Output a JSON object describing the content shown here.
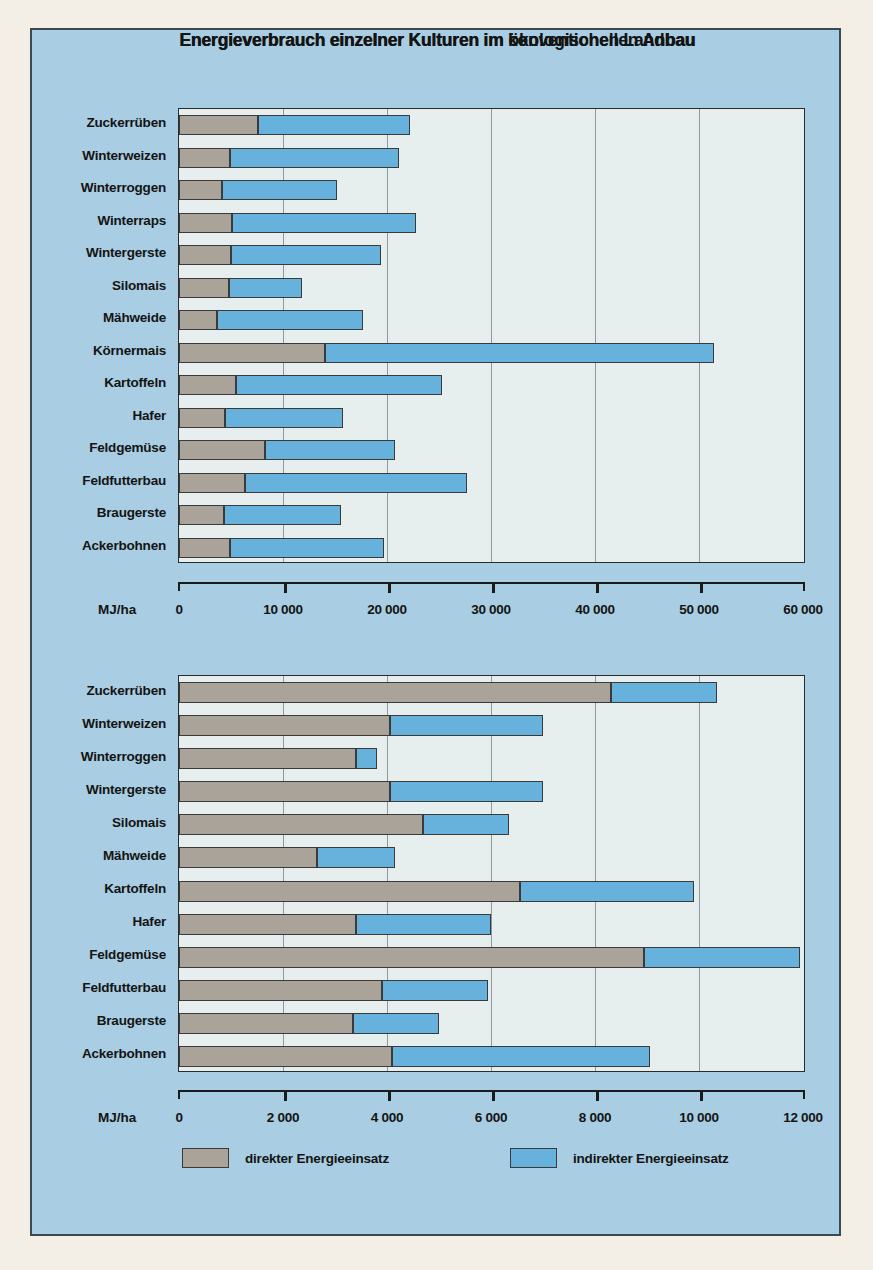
{
  "poster": {
    "background_color": "#a9cde2",
    "page_color": "#f3efe6",
    "border_color": "#3a4a52"
  },
  "legend": {
    "direct": {
      "label": "direkter Energieeinsatz",
      "color": "#a9a39a"
    },
    "indirect": {
      "label": "indirekter Energieeinsatz",
      "color": "#66b2dd"
    }
  },
  "chart_data": [
    {
      "type": "bar",
      "orientation": "horizontal",
      "stacked": true,
      "title": "Energieverbrauch einzelner Kulturen im konventionellen Anbau",
      "xlabel": "MJ/ha",
      "ylabel": "",
      "xlim": [
        0,
        60000
      ],
      "xticks": [
        0,
        10000,
        20000,
        30000,
        40000,
        50000,
        60000
      ],
      "xticklabels": [
        "0",
        "10 000",
        "20 000",
        "30 000",
        "40 000",
        "50 000",
        "60 000"
      ],
      "grid": true,
      "legend_position": "bottom",
      "categories": [
        "Zuckerrüben",
        "Winterweizen",
        "Winterroggen",
        "Winterraps",
        "Wintergerste",
        "Silomais",
        "Mähweide",
        "Körnermais",
        "Kartoffeln",
        "Hafer",
        "Feldgemüse",
        "Feldfutterbau",
        "Braugerste",
        "Ackerbohnen"
      ],
      "series": [
        {
          "name": "direkter Energieeinsatz",
          "color": "#a9a39a",
          "values": [
            7600,
            4900,
            4100,
            5100,
            5000,
            4800,
            3700,
            14000,
            5500,
            4400,
            8300,
            6300,
            4300,
            4900
          ]
        },
        {
          "name": "indirekter Energieeinsatz",
          "color": "#66b2dd",
          "values": [
            14600,
            16300,
            11100,
            17700,
            14400,
            7000,
            14000,
            37400,
            19800,
            11400,
            12500,
            21400,
            11300,
            14800
          ]
        }
      ],
      "totals": [
        22200,
        21200,
        15200,
        22800,
        19400,
        11800,
        17700,
        51400,
        25300,
        15800,
        20800,
        27700,
        15600,
        19700
      ]
    },
    {
      "type": "bar",
      "orientation": "horizontal",
      "stacked": true,
      "title": "Energieverbrauch einzelner Kulturen im ökologischen Landbau",
      "xlabel": "MJ/ha",
      "ylabel": "",
      "xlim": [
        0,
        12000
      ],
      "xticks": [
        0,
        2000,
        4000,
        6000,
        8000,
        10000,
        12000
      ],
      "xticklabels": [
        "0",
        "2 000",
        "4 000",
        "6 000",
        "8 000",
        "10 000",
        "12 000"
      ],
      "grid": true,
      "legend_position": "bottom",
      "categories": [
        "Zuckerrüben",
        "Winterweizen",
        "Winterroggen",
        "Wintergerste",
        "Silomais",
        "Mähweide",
        "Kartoffeln",
        "Hafer",
        "Feldgemüse",
        "Feldfutterbau",
        "Braugerste",
        "Ackerbohnen"
      ],
      "series": [
        {
          "name": "direkter Energieeinsatz",
          "color": "#a9a39a",
          "values": [
            8300,
            4050,
            3400,
            4050,
            4700,
            2650,
            6550,
            3400,
            8950,
            3900,
            3350,
            4100
          ]
        },
        {
          "name": "indirekter Energieeinsatz",
          "color": "#66b2dd",
          "values": [
            2050,
            2950,
            400,
            2950,
            1650,
            1500,
            3350,
            2600,
            3000,
            2050,
            1650,
            4950
          ]
        }
      ],
      "totals": [
        10350,
        7000,
        3800,
        7000,
        6350,
        4150,
        9900,
        6000,
        11950,
        5950,
        5000,
        9050
      ]
    }
  ]
}
